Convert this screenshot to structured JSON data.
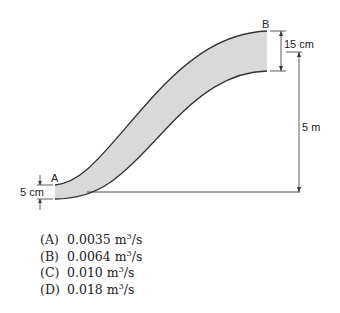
{
  "diagram": {
    "point_a_label": "A",
    "point_b_label": "B",
    "dim_a_diameter": "5 cm",
    "dim_b_diameter": "15 cm",
    "dim_height": "5 m",
    "colors": {
      "pipe_fill": "#d9d9d9",
      "line": "#333333"
    }
  },
  "answers": [
    {
      "letter": "(A)",
      "value": "0.0035 m",
      "exp": "3",
      "unit": "/s"
    },
    {
      "letter": "(B)",
      "value": "0.0064 m",
      "exp": "3",
      "unit": "/s"
    },
    {
      "letter": "(C)",
      "value": "0.010 m",
      "exp": "3",
      "unit": "/s"
    },
    {
      "letter": "(D)",
      "value": "0.018 m",
      "exp": "3",
      "unit": "/s"
    }
  ]
}
